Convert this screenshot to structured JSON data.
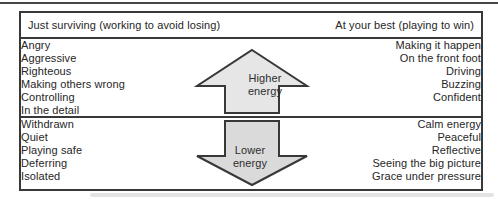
{
  "colors": {
    "border": "#383838",
    "text": "#262626",
    "arrow_fill_up": "#e6e6e6",
    "arrow_fill_down": "#dadada",
    "arrow_stroke": "#383838"
  },
  "header": {
    "left": "Just surviving (working to avoid losing)",
    "right": "At your best (playing to win)"
  },
  "sections": [
    {
      "arrow": {
        "direction": "up",
        "label_line1": "Higher",
        "label_line2": "energy"
      },
      "left_items": [
        "Angry",
        "Aggressive",
        "Righteous",
        "Making others wrong",
        "Controlling",
        "In the detail"
      ],
      "right_items": [
        "Making it happen",
        "On the front foot",
        "Driving",
        "Buzzing",
        "Confident"
      ]
    },
    {
      "arrow": {
        "direction": "down",
        "label_line1": "Lower",
        "label_line2": "energy"
      },
      "left_items": [
        "Withdrawn",
        "Quiet",
        "Playing safe",
        "Deferring",
        "Isolated"
      ],
      "right_items": [
        "Calm energy",
        "Peaceful",
        "Reflective",
        "Seeing the big picture",
        "Grace under pressure"
      ]
    }
  ]
}
